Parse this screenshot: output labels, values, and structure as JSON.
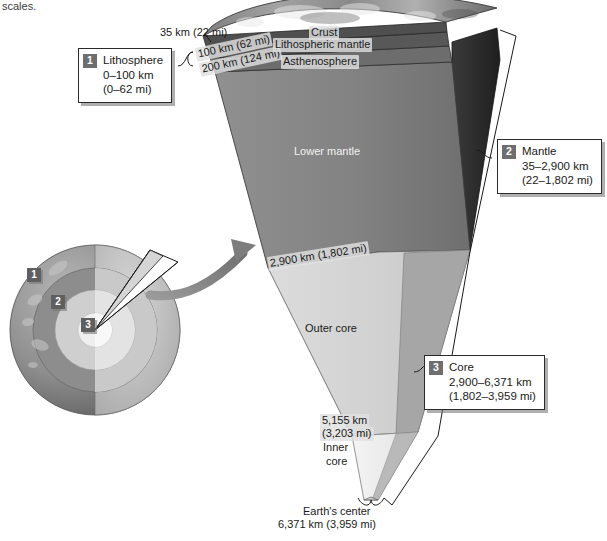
{
  "caption_fragment": "scales.",
  "callouts": [
    {
      "number": "1",
      "title": "Lithosphere",
      "range_km": "0–100 km",
      "range_mi": "(0–62 mi)"
    },
    {
      "number": "2",
      "title": "Mantle",
      "range_km": "35–2,900 km",
      "range_mi": "(22–1,802 mi)"
    },
    {
      "number": "3",
      "title": "Core",
      "range_km": "2,900–6,371 km",
      "range_mi": "(1,802–3,959 mi)"
    }
  ],
  "globe_badges": [
    {
      "number": "1"
    },
    {
      "number": "2"
    },
    {
      "number": "3"
    }
  ],
  "wedge_labels": {
    "crust": "Crust",
    "lithospheric_mantle": "Lithospheric mantle",
    "asthenosphere": "Asthenosphere",
    "lower_mantle": "Lower mantle",
    "outer_core": "Outer core",
    "inner_core_line1": "Inner",
    "inner_core_line2": "core"
  },
  "depth_annotations": {
    "crust_depth": "35 km (22 mi)",
    "lithosphere_base": "100 km (62 mi)",
    "asthenosphere_base": "200 km (124 mi)",
    "mantle_base": "2,900 km (1,802 mi)",
    "inner_core_top_km": "5,155 km",
    "inner_core_top_mi": "(3,203 mi)",
    "earth_center_label": "Earth's center",
    "earth_center_value": "6,371 km (3,959 mi)"
  },
  "colors": {
    "crust_surface": "#8f8f8f",
    "lithospheric_mantle": "#5a5a5a",
    "asthenosphere": "#6d6d6d",
    "lower_mantle": "#808080",
    "outer_core": "#d2d2d2",
    "inner_core": "#f0f0f0",
    "shadow_face": "#2b2b2b",
    "badge_gray": "#6e6e6e",
    "outline": "#1a1a1a"
  }
}
